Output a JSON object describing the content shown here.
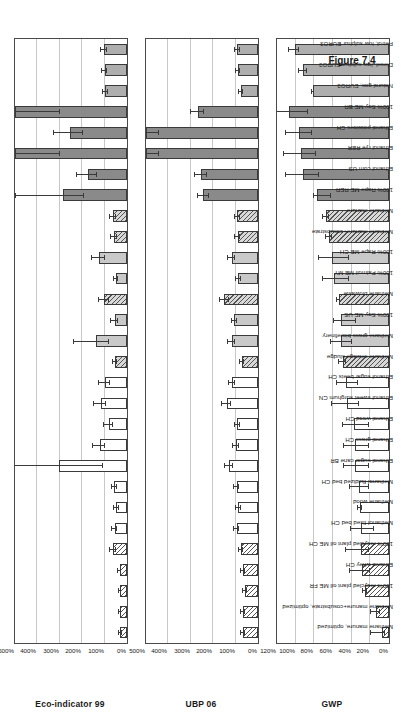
{
  "figure": {
    "caption": "Figure 7.4"
  },
  "chart_data": [
    {
      "type": "bar",
      "title": "Eco-indicator 99",
      "ylabel": "Eco-indicator 99",
      "xlabel": "",
      "ylim": [
        0,
        500
      ],
      "yticks": [
        "0%",
        "100%",
        "200%",
        "300%",
        "400%",
        "500%"
      ],
      "ytick_values": [
        0,
        100,
        200,
        300,
        400,
        500
      ],
      "grid": true,
      "legend": "none",
      "categories": [
        "Methane manure, optimized",
        "Methane manure+cosubstrate, optimized",
        "100% recycled plant oil ME FR",
        "Ethanol whey CH",
        "100% recycled plant oil ME CH",
        "Methanol fixed bed CH",
        "Methane wood",
        "Methanol fluidized bed CH",
        "Ethanol sugar cane BR",
        "Ethanol grass CH",
        "Ethanol wood CH",
        "Ethanol sweet sorghum CN",
        "Ethanol sugar beets CH",
        "Methane sewage sludge",
        "Methane grass biorefinery",
        "100% Soy ME US",
        "Methane biowaste",
        "100% Palmoil ME MY",
        "100% Rape ME CH",
        "Methane manure+cosubstrate",
        "Methane manure",
        "100% Rape ME RER",
        "Ethanol corn US",
        "Ethanol rye RER",
        "Ethanol potatoes CH",
        "100% Soy ME BR",
        "Natural gas, EURO3",
        "Diesel, low sulphur EURO3",
        "Petrol, low sulphur EURO3"
      ],
      "values": [
        30,
        32,
        30,
        33,
        62,
        55,
        48,
        57,
        305,
        122,
        82,
        118,
        100,
        54,
        140,
        55,
        102,
        50,
        125,
        58,
        62,
        285,
        175,
        500,
        255,
        500,
        97,
        100,
        103
      ],
      "err_low": [
        6,
        6,
        5,
        6,
        12,
        12,
        10,
        12,
        200,
        25,
        18,
        25,
        22,
        10,
        60,
        14,
        22,
        10,
        28,
        12,
        13,
        95,
        42,
        200,
        60,
        200,
        10,
        11,
        12
      ],
      "err_high": [
        6,
        6,
        5,
        6,
        12,
        12,
        10,
        12,
        230,
        28,
        20,
        28,
        24,
        10,
        95,
        16,
        25,
        10,
        30,
        12,
        13,
        210,
        48,
        230,
        72,
        230,
        10,
        11,
        12
      ]
    },
    {
      "type": "bar",
      "title": "UBP 06",
      "ylabel": "UBP 06",
      "xlabel": "",
      "ylim": [
        0,
        500
      ],
      "yticks": [
        "0%",
        "100%",
        "200%",
        "300%",
        "400%",
        "500%"
      ],
      "ytick_values": [
        0,
        100,
        200,
        300,
        400,
        500
      ],
      "grid": true,
      "legend": "none",
      "categories": [
        "Methane manure, optimized",
        "Methane manure+cosubstrate, optimized",
        "100% recycled plant oil ME FR",
        "Ethanol whey CH",
        "100% recycled plant oil ME CH",
        "Methanol fixed bed CH",
        "Methane wood",
        "Methanol fluidized bed CH",
        "Ethanol sugar cane BR",
        "Ethanol grass CH",
        "Ethanol wood CH",
        "Ethanol sweet sorghum CN",
        "Ethanol sugar beets CH",
        "Methane sewage sludge",
        "Methane grass biorefinery",
        "100% Soy ME US",
        "Methane biowaste",
        "100% Palmoil ME MY",
        "100% Rape ME CH",
        "Methane manure+cosubstrate",
        "Methane manure",
        "100% Rape ME RER",
        "Ethanol corn US",
        "Ethanol rye RER",
        "Ethanol potatoes CH",
        "100% Soy ME BR",
        "Natural gas, EURO3",
        "Diesel, low sulphur EURO3",
        "Petrol, low sulphur EURO3"
      ],
      "values": [
        68,
        68,
        58,
        68,
        75,
        95,
        88,
        95,
        130,
        98,
        92,
        140,
        115,
        72,
        118,
        105,
        150,
        88,
        118,
        90,
        92,
        245,
        255,
        500,
        500,
        270,
        75,
        88,
        92
      ],
      "err_low": [
        8,
        8,
        7,
        8,
        9,
        12,
        10,
        12,
        18,
        12,
        11,
        20,
        14,
        9,
        16,
        13,
        20,
        10,
        15,
        11,
        11,
        25,
        28,
        60,
        60,
        30,
        8,
        9,
        10
      ],
      "err_high": [
        8,
        8,
        7,
        8,
        9,
        12,
        10,
        12,
        18,
        12,
        11,
        20,
        14,
        9,
        16,
        13,
        20,
        10,
        15,
        11,
        11,
        25,
        28,
        60,
        60,
        30,
        8,
        9,
        10
      ]
    },
    {
      "type": "bar",
      "title": "GWP",
      "ylabel": "GWP",
      "xlabel": "",
      "ylim": [
        0,
        120
      ],
      "yticks": [
        "0%",
        "20%",
        "40%",
        "60%",
        "80%",
        "100%",
        "120%"
      ],
      "ytick_values": [
        0,
        20,
        40,
        60,
        80,
        100,
        120
      ],
      "grid": true,
      "legend": "none",
      "categories": [
        "Methane manure, optimized",
        "Methane manure+cosubstrate, optimized",
        "100% recycled plant oil ME FR",
        "Ethanol whey CH",
        "100% recycled plant oil ME CH",
        "Methanol fixed bed CH",
        "Methane wood",
        "Methanol fluidized bed CH",
        "Ethanol sugar cane BR",
        "Ethanol grass CH",
        "Ethanol wood CH",
        "Ethanol sweet sorghum CN",
        "Ethanol sugar beets CH",
        "Methane sewage sludge",
        "Methane grass biorefinery",
        "100% Soy ME US",
        "Methane biowaste",
        "100% Palmoil ME MY",
        "100% Rape ME CH",
        "Methane manure+cosubstrate",
        "Methane manure",
        "100% Rape ME RER",
        "Ethanol corn US",
        "Ethanol rye RER",
        "Ethanol potatoes CH",
        "100% Soy ME BR",
        "Natural gas, EURO3",
        "Diesel, low sulphur EURO3",
        "Petrol, low sulphur EURO3"
      ],
      "values": [
        7,
        14,
        26,
        29,
        30,
        30,
        31,
        32,
        36,
        36,
        37,
        45,
        46,
        49,
        51,
        51,
        54,
        59,
        61,
        64,
        67,
        77,
        92,
        94,
        96,
        107,
        81,
        92,
        101
      ],
      "err_low": [
        3,
        4,
        2,
        9,
        9,
        14,
        2,
        11,
        15,
        15,
        16,
        13,
        13,
        3,
        11,
        16,
        2,
        16,
        18,
        3,
        3,
        15,
        17,
        16,
        13,
        20,
        1,
        4,
        5
      ],
      "err_high": [
        12,
        5,
        2,
        13,
        16,
        11,
        2,
        10,
        12,
        12,
        12,
        16,
        10,
        5,
        11,
        8,
        2,
        12,
        14,
        4,
        4,
        3,
        18,
        18,
        14,
        13,
        1,
        4,
        6
      ]
    }
  ],
  "bar_styles": [
    "f-hatch",
    "f-hatch",
    "f-hatch",
    "f-hatch",
    "f-hatch",
    "f-white",
    "f-white",
    "f-white",
    "f-white",
    "f-white",
    "f-white",
    "f-white",
    "f-white",
    "f-hatchg",
    "f-lgray",
    "f-lgray",
    "f-hatchg",
    "f-lgray",
    "f-lgray",
    "f-hatchg",
    "f-hatchg",
    "f-dgray",
    "f-dgray",
    "f-dgray",
    "f-dgray",
    "f-dgray",
    "f-mgray",
    "f-mgray",
    "f-mgray"
  ],
  "colors": {
    "hatch_fill": "#ffffff",
    "white_fill": "#ffffff",
    "light_gray_fill": "#c9c9c9",
    "dark_gray_fill": "#8a8a8a",
    "medium_gray_fill": "#aeaeae",
    "axis": "#4a4a4a",
    "gridline": "#c8c8c8",
    "error_bar": "#3a3a3a"
  }
}
